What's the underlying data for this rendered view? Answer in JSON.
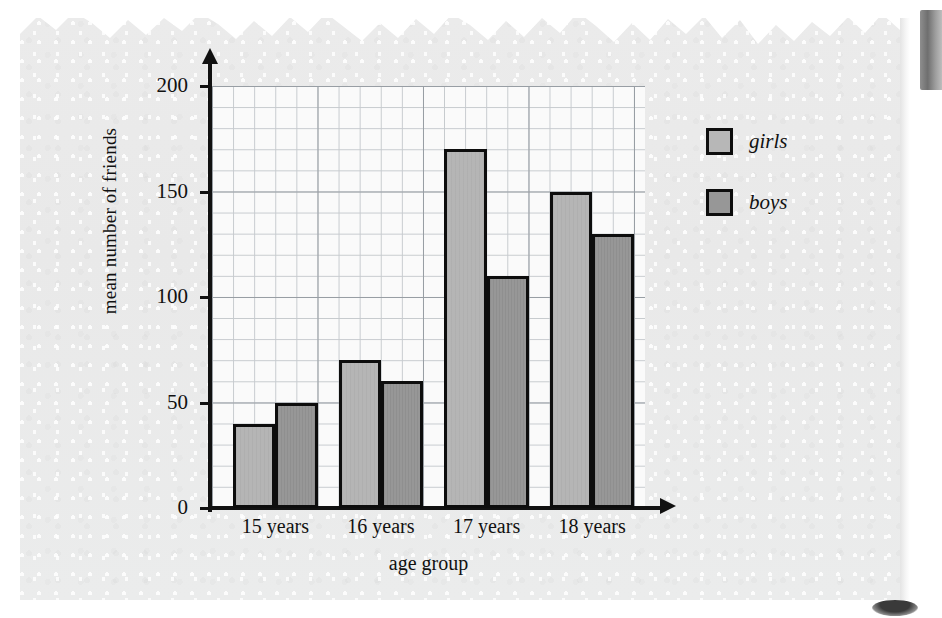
{
  "page": {
    "background_color": "#ffffff",
    "paper_color": "#eaeaea",
    "ink_color": "#111111"
  },
  "chart_data": {
    "type": "bar",
    "title": "",
    "xlabel": "age group",
    "ylabel": "mean number of friends",
    "categories": [
      "15 years",
      "16 years",
      "17 years",
      "18 years"
    ],
    "series": [
      {
        "name": "girls",
        "color": "#b5b5b5",
        "values": [
          40,
          70,
          170,
          150
        ]
      },
      {
        "name": "boys",
        "color": "#979797",
        "values": [
          50,
          60,
          110,
          130
        ]
      }
    ],
    "ylim": [
      0,
      200
    ],
    "ytick_labels": [
      "0",
      "50",
      "100",
      "150",
      "200"
    ],
    "ytick_values": [
      0,
      50,
      100,
      150,
      200
    ],
    "minor_gridline_step": 10,
    "grid": true,
    "legend_position": "right"
  },
  "legend": {
    "items": [
      {
        "label": "girls",
        "color": "#b5b5b5"
      },
      {
        "label": "boys",
        "color": "#979797"
      }
    ]
  },
  "decorations": {
    "torn_edge": "torn-paper-top-edge",
    "page_tab": "dark-page-edge-tab",
    "corner_mark": "dark-smudge-mark"
  }
}
